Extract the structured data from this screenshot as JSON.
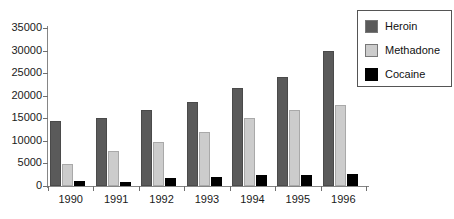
{
  "chart_data": {
    "type": "bar",
    "title": "",
    "subtitle": "",
    "xlabel": "",
    "ylabel": "",
    "categories": [
      "1990",
      "1991",
      "1992",
      "1993",
      "1994",
      "1995",
      "1996"
    ],
    "series": [
      {
        "name": "Heroin",
        "color": "#5a5a5a",
        "values": [
          14500,
          15000,
          16800,
          18700,
          21800,
          24200,
          30000
        ]
      },
      {
        "name": "Methadone",
        "color": "#cccccc",
        "values": [
          4900,
          7700,
          9700,
          11900,
          15100,
          16800,
          17900
        ]
      },
      {
        "name": "Cocaine",
        "color": "#000000",
        "values": [
          1100,
          1000,
          1700,
          2000,
          2500,
          2500,
          2600
        ]
      }
    ],
    "ylim": [
      0,
      35000
    ],
    "ytick_values": [
      0,
      5000,
      10000,
      15000,
      20000,
      25000,
      30000,
      35000
    ],
    "ytick_labels": [
      "0",
      "5000",
      "10000",
      "15000",
      "20000",
      "25000",
      "30000",
      "35000"
    ],
    "grid": false,
    "legend_position": "top-right",
    "legend_entries": [
      "Heroin",
      "Methadone",
      "Cocaine"
    ]
  }
}
